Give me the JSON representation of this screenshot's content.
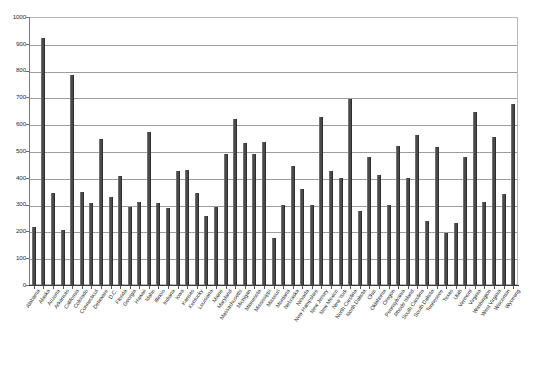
{
  "chart_data": {
    "type": "bar",
    "title": "",
    "subtitle": "",
    "xlabel": "",
    "ylabel": "",
    "ylim": [
      0,
      1000
    ],
    "ytick_step": 100,
    "yticks": [
      0,
      100,
      200,
      300,
      400,
      500,
      600,
      700,
      800,
      900,
      1000
    ],
    "grid": true,
    "legend": "none",
    "bar_color": "#4a4a4a",
    "plot_border_color": "#b9b9b9",
    "gridline_color": "#9d9d9d",
    "categories": [
      "Alabama",
      "Alaska",
      "Arizona",
      "Arkansas",
      "California",
      "Colorado",
      "Connecticut",
      "Delaware",
      "D.C.",
      "Florida",
      "Georgia",
      "Hawaii",
      "Idaho",
      "Illinois",
      "Indiana",
      "Iowa",
      "Kansas",
      "Kentucky",
      "Louisiana",
      "Maine",
      "Maryland",
      "Massachusetts",
      "Michigan",
      "Minnesota",
      "Mississippi",
      "Missouri",
      "Montana",
      "Nebraska",
      "Nevada",
      "New Hampshire",
      "New Jersey",
      "New Mexico",
      "New York",
      "North Carolina",
      "North Dakota",
      "Ohio",
      "Oklahoma",
      "Oregon",
      "Pennsylvania",
      "Rhode Island",
      "South Carolina",
      "South Dakota",
      "Tennessee",
      "Texas",
      "Utah",
      "Vermont",
      "Virginia",
      "Washington",
      "West Virginia",
      "Wisconsin",
      "Wyoming"
    ],
    "values": [
      215,
      920,
      345,
      205,
      785,
      348,
      305,
      543,
      330,
      408,
      290,
      310,
      570,
      305,
      287,
      425,
      430,
      345,
      258,
      290,
      490,
      618,
      530,
      490,
      533,
      175,
      297,
      445,
      360,
      300,
      628,
      425,
      400,
      693,
      277,
      478,
      410,
      297,
      520,
      400,
      558,
      240,
      515,
      193,
      232,
      478,
      645,
      310,
      553,
      340,
      675
    ]
  }
}
